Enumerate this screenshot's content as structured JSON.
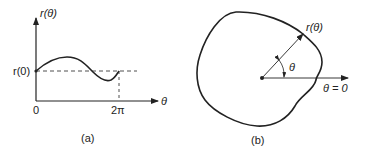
{
  "panel_a": {
    "caption": "(a)",
    "y_axis_label": "r(θ)",
    "x_axis_label": "θ",
    "r0_label": "r(0)",
    "tick_origin": "0",
    "tick_period": "2π",
    "description": "r as a function of θ over one period, starting and ending at r(0)"
  },
  "panel_b": {
    "caption": "(b)",
    "radius_label": "r(θ)",
    "angle_label": "θ",
    "reference_label": "θ = 0",
    "description": "closed curve in polar coordinates traced by r(θ) around the origin"
  }
}
